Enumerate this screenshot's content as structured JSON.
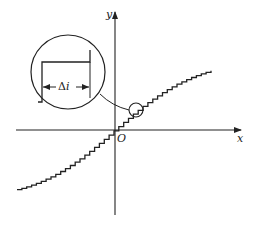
{
  "diagram": {
    "title": "",
    "axes": {
      "x_label": "x",
      "y_label": "y",
      "origin_label": "O"
    },
    "magnifier": {
      "step_label_symbol": "Δ",
      "step_label_var": "i"
    },
    "colors": {
      "stroke": "#222222",
      "background": "#ffffff"
    }
  }
}
